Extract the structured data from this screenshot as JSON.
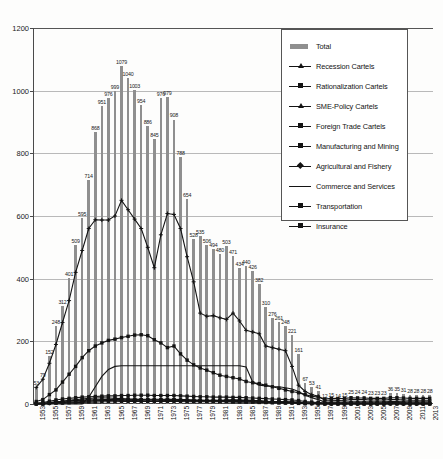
{
  "chart_data": {
    "type": "bar",
    "title": "",
    "xlabel": "",
    "ylabel": "",
    "ylim": [
      0,
      1200
    ],
    "ytick_values": [
      0,
      200,
      400,
      600,
      800,
      1000,
      1200
    ],
    "ytick_labels": [
      "0",
      "200",
      "400",
      "600",
      "800",
      "1000",
      "1200"
    ],
    "grid": true,
    "legend_position": "top-right",
    "x": [
      1953,
      1954,
      1955,
      1956,
      1957,
      1958,
      1959,
      1960,
      1961,
      1962,
      1963,
      1964,
      1965,
      1966,
      1967,
      1968,
      1969,
      1970,
      1971,
      1972,
      1973,
      1974,
      1975,
      1976,
      1977,
      1978,
      1979,
      1980,
      1981,
      1982,
      1983,
      1984,
      1985,
      1986,
      1987,
      1988,
      1989,
      1990,
      1991,
      1992,
      1993,
      1994,
      1995,
      1996,
      1997,
      1998,
      1999,
      2000,
      2001,
      2002,
      2003,
      2004,
      2005,
      2006,
      2007,
      2008,
      2009,
      2010,
      2011,
      2012,
      2013
    ],
    "xtick_labels": [
      "1953",
      "1955",
      "1957",
      "1959",
      "1961",
      "1963",
      "1965",
      "1967",
      "1969",
      "1971",
      "1973",
      "1975",
      "1977",
      "1979",
      "1981",
      "1983",
      "1985",
      "1987",
      "1989",
      "1991",
      "1993",
      "1995",
      "1997",
      "1999",
      "2001",
      "2003",
      "2005",
      "2007",
      "2009",
      "2011",
      "2013"
    ],
    "series": [
      {
        "name": "Total",
        "kind": "bar",
        "color": "#8f8f8f",
        "values": [
          53,
          79,
          152,
          248,
          312,
          401,
          509,
          595,
          714,
          868,
          951,
          976,
          999,
          1079,
          1040,
          1003,
          954,
          886,
          845,
          976,
          979,
          908,
          788,
          654,
          528,
          535,
          506,
          494,
          480,
          503,
          471,
          434,
          440,
          426,
          382,
          310,
          276,
          261,
          248,
          221,
          161,
          67,
          53,
          41,
          12,
          15,
          14,
          15,
          25,
          24,
          24,
          23,
          23,
          23,
          36,
          35,
          31,
          28,
          28,
          28,
          28
        ],
        "labels": [
          "53",
          "79",
          "152",
          "248",
          "312",
          "401",
          "509",
          "595",
          "714",
          "868",
          "951",
          "976",
          "999",
          "1079",
          "1040",
          "1003",
          "954",
          "886",
          "845",
          "976",
          "979",
          "908",
          "788",
          "654",
          "528",
          "535",
          "506",
          "494",
          "480",
          "503",
          "471",
          "434",
          "440",
          "426",
          "382",
          "310",
          "276",
          "261",
          "248",
          "221",
          "161",
          "67",
          "53",
          "41",
          "12",
          "15",
          "14",
          "15",
          "25",
          "24",
          "24",
          "23",
          "23",
          "23",
          "36",
          "35",
          "31",
          "28",
          "28",
          "28",
          "28"
        ]
      },
      {
        "name": "Recession Cartels",
        "kind": "line",
        "color": "#141414",
        "marker": "plus",
        "values": [
          0,
          0,
          2,
          6,
          5,
          9,
          11,
          12,
          13,
          13,
          13,
          12,
          12,
          13,
          12,
          11,
          10,
          9,
          8,
          10,
          11,
          12,
          12,
          10,
          9,
          10,
          11,
          12,
          11,
          13,
          14,
          13,
          13,
          12,
          10,
          8,
          7,
          6,
          5,
          5,
          4,
          2,
          1,
          1,
          0,
          0,
          0,
          0,
          0,
          0,
          0,
          0,
          0,
          0,
          0,
          0,
          0,
          0,
          0,
          0,
          0
        ]
      },
      {
        "name": "Rationalization Cartels",
        "kind": "line",
        "color": "#141414",
        "marker": "square",
        "values": [
          0,
          0,
          3,
          7,
          9,
          12,
          14,
          16,
          18,
          19,
          20,
          19,
          18,
          17,
          16,
          15,
          14,
          13,
          12,
          13,
          14,
          13,
          12,
          11,
          10,
          10,
          9,
          9,
          8,
          8,
          8,
          8,
          7,
          7,
          6,
          5,
          4,
          4,
          3,
          3,
          2,
          1,
          1,
          0,
          0,
          0,
          0,
          0,
          0,
          0,
          0,
          0,
          0,
          0,
          0,
          0,
          0,
          0,
          0,
          0,
          0
        ]
      },
      {
        "name": "SME-Policy Cartels",
        "kind": "line",
        "color": "#141414",
        "marker": "plus",
        "values": [
          53,
          79,
          130,
          190,
          260,
          330,
          420,
          490,
          560,
          588,
          587,
          587,
          600,
          650,
          620,
          590,
          560,
          500,
          435,
          540,
          608,
          605,
          560,
          470,
          390,
          290,
          280,
          282,
          275,
          270,
          290,
          265,
          235,
          230,
          224,
          185,
          180,
          175,
          170,
          120,
          60,
          40,
          30,
          25,
          12,
          12,
          11,
          12,
          14,
          14,
          14,
          13,
          13,
          13,
          14,
          14,
          13,
          12,
          12,
          12,
          12
        ]
      },
      {
        "name": "Foreign Trade Cartels",
        "kind": "line",
        "color": "#141414",
        "marker": "square",
        "values": [
          8,
          14,
          30,
          45,
          70,
          95,
          120,
          148,
          170,
          185,
          195,
          203,
          207,
          212,
          216,
          220,
          221,
          218,
          205,
          195,
          180,
          185,
          160,
          140,
          125,
          115,
          108,
          100,
          92,
          88,
          84,
          80,
          72,
          68,
          65,
          60,
          55,
          50,
          45,
          40,
          36,
          30,
          25,
          22,
          16,
          18,
          17,
          18,
          20,
          19,
          19,
          18,
          18,
          18,
          20,
          20,
          19,
          18,
          18,
          18,
          18
        ]
      },
      {
        "name": "Manufacturing and Mining",
        "kind": "line",
        "color": "#141414",
        "marker": "square",
        "values": [
          3,
          5,
          9,
          13,
          16,
          18,
          20,
          22,
          23,
          24,
          25,
          26,
          26,
          27,
          27,
          28,
          28,
          28,
          27,
          27,
          27,
          27,
          26,
          25,
          24,
          23,
          23,
          22,
          22,
          22,
          21,
          21,
          20,
          19,
          18,
          17,
          16,
          15,
          14,
          13,
          11,
          8,
          6,
          5,
          3,
          3,
          3,
          3,
          4,
          4,
          4,
          4,
          4,
          4,
          5,
          5,
          4,
          4,
          4,
          4,
          4
        ]
      },
      {
        "name": "Agricultural and Fishery",
        "kind": "line",
        "color": "#141414",
        "marker": "diamond",
        "values": [
          2,
          3,
          5,
          7,
          9,
          10,
          11,
          12,
          13,
          13,
          14,
          14,
          14,
          15,
          15,
          15,
          15,
          15,
          15,
          15,
          15,
          15,
          14,
          14,
          13,
          13,
          12,
          12,
          12,
          12,
          11,
          11,
          11,
          10,
          10,
          9,
          8,
          8,
          7,
          7,
          6,
          4,
          3,
          3,
          2,
          2,
          2,
          2,
          2,
          2,
          2,
          2,
          2,
          2,
          3,
          3,
          2,
          2,
          2,
          2,
          2
        ]
      },
      {
        "name": "Commerce and Services",
        "kind": "line",
        "color": "#141414",
        "marker": "none",
        "values": [
          0,
          0,
          0,
          0,
          0,
          0,
          0,
          0,
          22,
          55,
          88,
          110,
          120,
          122,
          122,
          122,
          122,
          122,
          122,
          122,
          122,
          122,
          122,
          122,
          122,
          122,
          122,
          122,
          122,
          122,
          122,
          122,
          118,
          70,
          60,
          58,
          56,
          55,
          52,
          48,
          40,
          28,
          20,
          14,
          6,
          6,
          6,
          6,
          7,
          7,
          7,
          7,
          7,
          7,
          8,
          8,
          7,
          7,
          7,
          7,
          7
        ]
      },
      {
        "name": "Transportation",
        "kind": "line",
        "color": "#141414",
        "marker": "square",
        "values": [
          1,
          2,
          3,
          4,
          5,
          6,
          7,
          8,
          9,
          10,
          11,
          11,
          12,
          12,
          12,
          13,
          13,
          13,
          13,
          13,
          13,
          13,
          12,
          12,
          12,
          11,
          11,
          11,
          11,
          11,
          10,
          10,
          10,
          9,
          9,
          8,
          8,
          7,
          7,
          6,
          5,
          4,
          3,
          3,
          2,
          2,
          2,
          2,
          2,
          2,
          2,
          2,
          2,
          2,
          3,
          3,
          2,
          2,
          2,
          2,
          2
        ]
      },
      {
        "name": "Insurance",
        "kind": "line",
        "color": "#141414",
        "marker": "square",
        "values": [
          1,
          1,
          2,
          3,
          3,
          4,
          5,
          5,
          6,
          6,
          7,
          7,
          7,
          8,
          8,
          8,
          8,
          8,
          8,
          8,
          8,
          8,
          8,
          7,
          7,
          7,
          7,
          7,
          7,
          7,
          6,
          6,
          6,
          6,
          5,
          5,
          5,
          4,
          4,
          4,
          3,
          2,
          2,
          2,
          1,
          1,
          1,
          1,
          1,
          1,
          1,
          1,
          1,
          1,
          2,
          2,
          1,
          1,
          1,
          1,
          1
        ]
      }
    ]
  },
  "legend": {
    "items": [
      {
        "label": "Total",
        "key": "bar"
      },
      {
        "label": "Recession Cartels",
        "key": "line-plus"
      },
      {
        "label": "Rationalization Cartels",
        "key": "line-square"
      },
      {
        "label": "SME-Policy Cartels",
        "key": "line-plus"
      },
      {
        "label": "Foreign Trade Cartels",
        "key": "line-square"
      },
      {
        "label": "Manufacturing and Mining",
        "key": "line-square"
      },
      {
        "label": "Agricultural and Fishery",
        "key": "line-diamond"
      },
      {
        "label": "Commerce and Services",
        "key": "line-plain"
      },
      {
        "label": "Transportation",
        "key": "line-square"
      },
      {
        "label": "Insurance",
        "key": "line-square"
      }
    ]
  },
  "colors": {
    "bar": "#8f8f8f",
    "line": "#141414",
    "grid": "#b9b9b9",
    "axis": "#4a4a4a"
  }
}
